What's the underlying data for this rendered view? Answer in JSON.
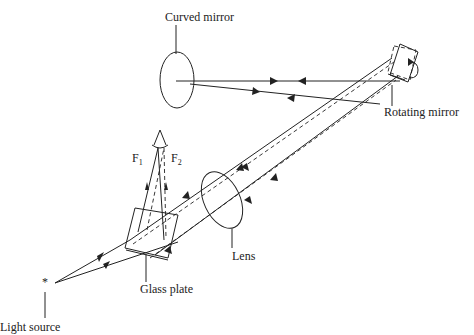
{
  "diagram": {
    "type": "optical setup (rotating mirror method for speed of light)",
    "labels": {
      "curved_mirror": "Curved mirror",
      "rotating_mirror": "Rotating mirror",
      "lens": "Lens",
      "glass_plate": "Glass plate",
      "light_source": "Light source",
      "f1": "F",
      "f1_sub": "1",
      "f2": "F",
      "f2_sub": "2"
    },
    "components": [
      {
        "name": "light-source",
        "symbol": "*"
      },
      {
        "name": "glass-plate"
      },
      {
        "name": "lens"
      },
      {
        "name": "rotating-mirror"
      },
      {
        "name": "curved-mirror"
      },
      {
        "name": "eye",
        "note": "observer eye above F1/F2"
      }
    ],
    "colors": {
      "line": "#222222",
      "background": "#ffffff"
    }
  }
}
